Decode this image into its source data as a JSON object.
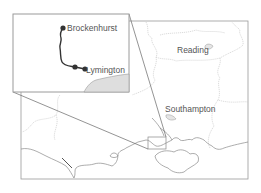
{
  "map": {
    "region": "South of England (Hampshire / Berkshire)",
    "inset": {
      "labels": [
        {
          "text": "Brockenhurst",
          "x": 67,
          "y": 23
        },
        {
          "text": "Lymington",
          "x": 85,
          "y": 65
        }
      ],
      "route_stations": [
        "Brockenhurst",
        "Lymington"
      ]
    },
    "main_labels": [
      {
        "text": "Reading",
        "x": 177,
        "y": 45
      },
      {
        "text": "Southampton",
        "x": 165,
        "y": 103
      }
    ],
    "colors": {
      "frame": "#999999",
      "coast": "#888888",
      "boundary": "#bbbbbb",
      "route": "#333333",
      "sea_fill": "#dddddd",
      "label": "#555555"
    }
  }
}
